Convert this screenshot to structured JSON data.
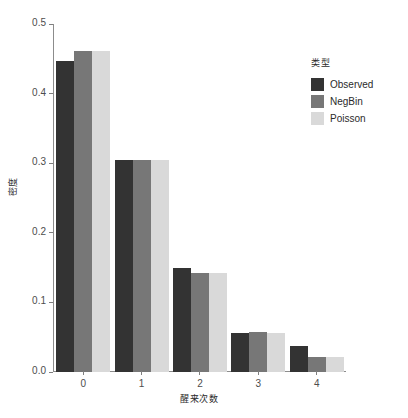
{
  "chart_data": {
    "type": "bar",
    "title": "",
    "subtitle": "",
    "xlabel": "醒来次数",
    "ylabel": "密度",
    "categories": [
      "0",
      "1",
      "2",
      "3",
      "4"
    ],
    "series": [
      {
        "name": "Observed",
        "color": "#333333",
        "values": [
          0.447,
          0.305,
          0.149,
          0.056,
          0.038
        ]
      },
      {
        "name": "NegBin",
        "color": "#777777",
        "values": [
          0.461,
          0.304,
          0.142,
          0.057,
          0.022
        ]
      },
      {
        "name": "Poisson",
        "color": "#d9d9d9",
        "values": [
          0.461,
          0.304,
          0.142,
          0.056,
          0.022
        ]
      }
    ],
    "ylim": [
      0.0,
      0.5
    ],
    "yticks": [
      "0.0",
      "0.1",
      "0.2",
      "0.3",
      "0.4",
      "0.5"
    ],
    "ytick_values": [
      0.0,
      0.1,
      0.2,
      0.3,
      0.4,
      0.5
    ],
    "grid": false,
    "legend": {
      "title": "类型",
      "position": "right",
      "entries": [
        "Observed",
        "NegBin",
        "Poisson"
      ]
    }
  }
}
